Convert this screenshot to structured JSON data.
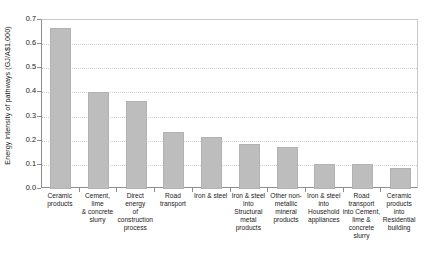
{
  "chart_data": {
    "type": "bar",
    "title": "",
    "xlabel": "",
    "ylabel": "Energy intensity of pathways (GJ/A$1,000)",
    "ylim": [
      0.0,
      0.7
    ],
    "ytick_labels": [
      "0.7",
      "0.6",
      "0.5",
      "0.4",
      "0.3",
      "0.2",
      "0.1",
      "0.0"
    ],
    "ytick_values": [
      0.7,
      0.6,
      0.5,
      0.4,
      0.3,
      0.2,
      0.1,
      0.0
    ],
    "grid": "horizontal-dotted",
    "legend": "none",
    "bar_color": "#bdbdbd",
    "categories": [
      "Ceramic products",
      "Cement, lime & concrete slurry",
      "Direct energy of construction process",
      "Road transport",
      "Iron & steel",
      "Iron & steel into Structural metal products",
      "Other non-metallic mineral products",
      "Iron & steel into Household appliances",
      "Road transport into Cement, lime & concrete slurry",
      "Ceramic products into Residential building"
    ],
    "values": [
      0.665,
      0.402,
      0.365,
      0.238,
      0.217,
      0.188,
      0.172,
      0.105,
      0.105,
      0.087
    ],
    "bars": [
      {
        "label": "Ceramic products",
        "value": 0.665
      },
      {
        "label": "Cement, lime & concrete slurry",
        "value": 0.402
      },
      {
        "label": "Direct energy of construction process",
        "value": 0.365
      },
      {
        "label": "Road transport",
        "value": 0.238
      },
      {
        "label": "Iron & steel",
        "value": 0.217
      },
      {
        "label": "Iron & steel into Structural metal products",
        "value": 0.188
      },
      {
        "label": "Other non-metallic mineral products",
        "value": 0.172
      },
      {
        "label": "Iron & steel into Household appliances",
        "value": 0.105
      },
      {
        "label": "Road transport into Cement, lime & concrete slurry",
        "value": 0.105
      },
      {
        "label": "Ceramic products into Residential building",
        "value": 0.087
      }
    ]
  },
  "axis": {
    "y_title": "Energy intensity of pathways (GJ/A$1,000)",
    "y_ticks": [
      {
        "label": "0.7",
        "value": 0.7
      },
      {
        "label": "0.6",
        "value": 0.6
      },
      {
        "label": "0.5",
        "value": 0.5
      },
      {
        "label": "0.4",
        "value": 0.4
      },
      {
        "label": "0.3",
        "value": 0.3
      },
      {
        "label": "0.2",
        "value": 0.2
      },
      {
        "label": "0.1",
        "value": 0.1
      },
      {
        "label": "0.0",
        "value": 0.0
      }
    ]
  },
  "x_labels": [
    {
      "lines": [
        "Ceramic",
        "products"
      ]
    },
    {
      "lines": [
        "Cement, lime",
        "& concrete",
        "slurry"
      ]
    },
    {
      "lines": [
        "Direct energy",
        "of",
        "construction",
        "process"
      ]
    },
    {
      "lines": [
        "Road",
        "transport"
      ]
    },
    {
      "lines": [
        "Iron & steel"
      ]
    },
    {
      "lines": [
        "Iron & steel",
        "into",
        "Structural",
        "metal",
        "products"
      ]
    },
    {
      "lines": [
        "Other non-",
        "metallic",
        "mineral",
        "products"
      ]
    },
    {
      "lines": [
        "Iron & steel",
        "into",
        "Household",
        "appliances"
      ]
    },
    {
      "lines": [
        "Road",
        "transport",
        "into Cement,",
        "lime &",
        "concrete",
        "slurry"
      ]
    },
    {
      "lines": [
        "Ceramic",
        "products into",
        "Residential",
        "building"
      ]
    }
  ]
}
